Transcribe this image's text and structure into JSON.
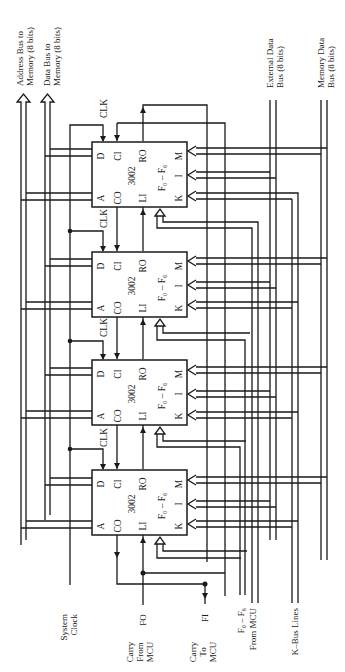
{
  "diagram": {
    "colors": {
      "ink": "#1a1a1a",
      "background": "#ffffff"
    },
    "outputs": {
      "address_bus": {
        "line1": "Address Bus to",
        "line2": "Memory (8 bits)"
      },
      "data_bus": {
        "line1": "Data Bus to",
        "line2": "Memory (8 bits)"
      }
    },
    "right_inputs": {
      "external_data_bus": {
        "line1": "External Data",
        "line2": "Bus (8 bits)"
      },
      "memory_data_bus": {
        "line1": "Memory Data",
        "line2": "Bus (8 bits)"
      }
    },
    "bottom_inputs": {
      "system_clock": {
        "line1": "System",
        "line2": "Clock"
      },
      "carry_from_mcu": {
        "line1": "Carry",
        "line2": "From",
        "line3": "MCU",
        "pin": "FO"
      },
      "carry_to_mcu": {
        "line1": "Carry",
        "line2": "To",
        "line3": "MCU",
        "pin": "FI"
      },
      "f_from_mcu": {
        "line1": "F₀ – F₆",
        "line2": "From MCU"
      },
      "k_bus": {
        "line1": "K–Bus Lines"
      }
    },
    "clk_label": "CLK",
    "blocks": [
      {
        "name": "3002",
        "function": "F₀ – F₆",
        "pins": {
          "D": "D",
          "CI": "CI",
          "RO": "RO",
          "M": "M",
          "A": "A",
          "CO": "CO",
          "LI": "LI",
          "I": "I",
          "K": "K"
        }
      },
      {
        "name": "3002",
        "function": "F₀ – F₆",
        "pins": {
          "D": "D",
          "CI": "CI",
          "RO": "RO",
          "M": "M",
          "A": "A",
          "CO": "CO",
          "LI": "LI",
          "I": "I",
          "K": "K"
        }
      },
      {
        "name": "3002",
        "function": "F₀ – F₆",
        "pins": {
          "D": "D",
          "CI": "CI",
          "RO": "RO",
          "M": "M",
          "A": "A",
          "CO": "CO",
          "LI": "LI",
          "I": "I",
          "K": "K"
        }
      },
      {
        "name": "3002",
        "function": "F₀ – F₆",
        "pins": {
          "D": "D",
          "CI": "CI",
          "RO": "RO",
          "M": "M",
          "A": "A",
          "CO": "CO",
          "LI": "LI",
          "I": "I",
          "K": "K"
        }
      }
    ]
  }
}
